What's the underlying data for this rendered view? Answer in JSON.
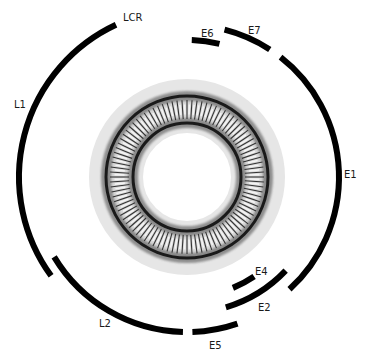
{
  "diagram": {
    "type": "circular-genome-map",
    "center": [
      187,
      177
    ],
    "colors": {
      "arc": "#000000",
      "outer_band": "#e6e6e6",
      "ring_dark": "#1a1a1a",
      "tick_band": "#d8d8d8",
      "tick": "#333333",
      "label": "#1a1a1a"
    },
    "rings": {
      "outer_band_r": 98,
      "inner_white_r": 44,
      "outer_dark_r": 81,
      "inner_dark_r": 54,
      "tick_count": 96
    },
    "segments": [
      {
        "id": "L1",
        "label": "L1",
        "r": 168,
        "start": 144,
        "end": 245,
        "label_pos": [
          14,
          108
        ]
      },
      {
        "id": "LCR",
        "label": "LCR",
        "r": 168,
        "start": 245,
        "end": 245,
        "label_pos": [
          123,
          21
        ]
      },
      {
        "id": "L2",
        "label": "L2",
        "r": 155,
        "start": 91.5,
        "end": 149,
        "label_pos": [
          99,
          327
        ]
      },
      {
        "id": "E5",
        "label": "E5",
        "r": 155,
        "start": 71,
        "end": 88,
        "label_pos": [
          209,
          349
        ]
      },
      {
        "id": "E2",
        "label": "E2",
        "r": 136,
        "start": 43.5,
        "end": 73.4,
        "label_pos": [
          258,
          311
        ]
      },
      {
        "id": "E4",
        "label": "E4",
        "r": 120,
        "start": 56,
        "end": 67.5,
        "label_pos": [
          255,
          275
        ]
      },
      {
        "id": "E1",
        "label": "E1",
        "r": 152,
        "start": -52,
        "end": 47.6,
        "label_pos": [
          344,
          178
        ]
      },
      {
        "id": "E7",
        "label": "E7",
        "r": 152,
        "start": -75.7,
        "end": -57,
        "label_pos": [
          248,
          34
        ]
      },
      {
        "id": "E6",
        "label": "E6",
        "r": 137,
        "start": -88,
        "end": -76.3,
        "label_pos": [
          201,
          37
        ]
      }
    ]
  }
}
